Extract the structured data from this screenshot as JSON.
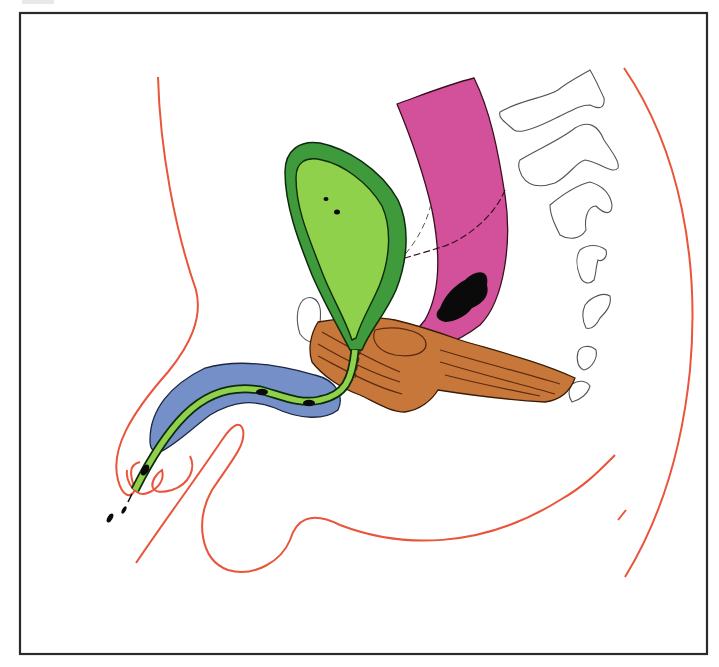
{
  "figure": {
    "title": "",
    "frame": {
      "x": 20,
      "y": 13,
      "width": 687,
      "height": 641,
      "stroke": "#2a2a2a"
    },
    "colors": {
      "body_outline": "#e8553a",
      "bladder_wall": "#3f9a3c",
      "bladder_lumen": "#8fd14a",
      "urethra": "#8fd14a",
      "rectum": "#d3509a",
      "stool": "#0a0a0a",
      "pelvic_floor_muscle": "#c8773a",
      "muscle_fibers": "#5a2a10",
      "corpus_spongiosum": "#7590c8",
      "bone_outline": "#555555",
      "ink": "#111111"
    },
    "structures": [
      {
        "id": "body-outline",
        "label": "body contour"
      },
      {
        "id": "bladder",
        "label": "bladder"
      },
      {
        "id": "urethra",
        "label": "urethra"
      },
      {
        "id": "rectum",
        "label": "rectum"
      },
      {
        "id": "fecal-mass",
        "label": "stool"
      },
      {
        "id": "pelvic-floor",
        "label": "pelvic floor muscle"
      },
      {
        "id": "penile-bulb",
        "label": "penis / corpus spongiosum"
      },
      {
        "id": "pubic-symphysis",
        "label": "pubic bone"
      },
      {
        "id": "sacrum-coccyx",
        "label": "sacrum and coccyx"
      },
      {
        "id": "urine-drops",
        "label": "urine stream"
      }
    ]
  }
}
